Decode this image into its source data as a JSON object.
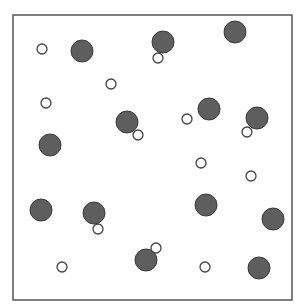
{
  "diagram": {
    "box": {
      "x": 13,
      "y": 15,
      "width": 279,
      "height": 285,
      "stroke": "#555555"
    },
    "colors": {
      "large_fill": "#5e5e5e",
      "large_stroke": "#3a3a3a",
      "small_fill": "#ffffff",
      "small_stroke": "#444444"
    },
    "large_circles": [
      {
        "cx": 82,
        "cy": 51,
        "r": 11
      },
      {
        "cx": 163,
        "cy": 42,
        "r": 11
      },
      {
        "cx": 235,
        "cy": 32,
        "r": 11
      },
      {
        "cx": 127,
        "cy": 122,
        "r": 11
      },
      {
        "cx": 209,
        "cy": 109,
        "r": 11
      },
      {
        "cx": 257,
        "cy": 118,
        "r": 11
      },
      {
        "cx": 50,
        "cy": 145,
        "r": 11
      },
      {
        "cx": 41,
        "cy": 210,
        "r": 11
      },
      {
        "cx": 94,
        "cy": 213,
        "r": 11
      },
      {
        "cx": 206,
        "cy": 205,
        "r": 11
      },
      {
        "cx": 273,
        "cy": 219,
        "r": 11
      },
      {
        "cx": 146,
        "cy": 260,
        "r": 11
      },
      {
        "cx": 259,
        "cy": 268,
        "r": 11
      }
    ],
    "small_circles": [
      {
        "cx": 42,
        "cy": 49,
        "r": 5
      },
      {
        "cx": 158,
        "cy": 58,
        "r": 5
      },
      {
        "cx": 111,
        "cy": 84,
        "r": 5
      },
      {
        "cx": 46,
        "cy": 103,
        "r": 5
      },
      {
        "cx": 138,
        "cy": 135,
        "r": 5
      },
      {
        "cx": 187,
        "cy": 119,
        "r": 5
      },
      {
        "cx": 247,
        "cy": 132,
        "r": 5
      },
      {
        "cx": 201,
        "cy": 163,
        "r": 5
      },
      {
        "cx": 251,
        "cy": 176,
        "r": 5
      },
      {
        "cx": 98,
        "cy": 229,
        "r": 5
      },
      {
        "cx": 156,
        "cy": 248,
        "r": 5
      },
      {
        "cx": 62,
        "cy": 267,
        "r": 5
      },
      {
        "cx": 205,
        "cy": 267,
        "r": 5
      }
    ]
  }
}
